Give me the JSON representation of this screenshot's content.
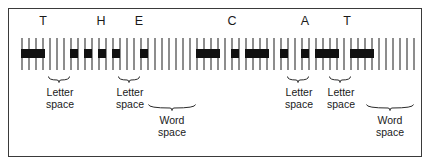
{
  "figure": {
    "message": "THE CAT",
    "border_color": "#3a3a3a",
    "tick_color": "#8d8d8d",
    "mark_color": "#111111",
    "background": "#ffffff"
  },
  "letters": [
    {
      "label": "T",
      "x": 43
    },
    {
      "label": "H",
      "x": 101
    },
    {
      "label": "E",
      "x": 139
    },
    {
      "label": "C",
      "x": 232
    },
    {
      "label": "A",
      "x": 305
    },
    {
      "label": "T",
      "x": 347
    }
  ],
  "strip": {
    "tick_top": 38,
    "tick_height": 32,
    "tick_width": 1.5,
    "mark_top": 49,
    "mark_height": 9,
    "tick_x": [
      21,
      28,
      35,
      42,
      49,
      56,
      63,
      70,
      77,
      84,
      91,
      98,
      105,
      112,
      119,
      126,
      133,
      140,
      147,
      154,
      161,
      168,
      175,
      182,
      189,
      196,
      203,
      210,
      217,
      224,
      231,
      238,
      245,
      252,
      259,
      266,
      273,
      280,
      287,
      294,
      301,
      308,
      315,
      322,
      329,
      336,
      343,
      350,
      357,
      364,
      371,
      378,
      385,
      392,
      399,
      406,
      413
    ],
    "marks": [
      {
        "x": 21,
        "width": 24,
        "symbol": "dash",
        "letter": "T"
      },
      {
        "x": 70,
        "width": 8,
        "symbol": "dot",
        "letter": "H"
      },
      {
        "x": 84,
        "width": 8,
        "symbol": "dot",
        "letter": "H"
      },
      {
        "x": 98,
        "width": 8,
        "symbol": "dot",
        "letter": "H"
      },
      {
        "x": 112,
        "width": 8,
        "symbol": "dot",
        "letter": "H"
      },
      {
        "x": 140,
        "width": 8,
        "symbol": "dot",
        "letter": "E"
      },
      {
        "x": 196,
        "width": 24,
        "symbol": "dash",
        "letter": "C"
      },
      {
        "x": 231,
        "width": 8,
        "symbol": "dot",
        "letter": "C"
      },
      {
        "x": 245,
        "width": 24,
        "symbol": "dash",
        "letter": "C"
      },
      {
        "x": 280,
        "width": 8,
        "symbol": "dot",
        "letter": "C"
      },
      {
        "x": 301,
        "width": 8,
        "symbol": "dot",
        "letter": "A"
      },
      {
        "x": 315,
        "width": 24,
        "symbol": "dash",
        "letter": "A"
      },
      {
        "x": 350,
        "width": 24,
        "symbol": "dash",
        "letter": "T"
      }
    ]
  },
  "annotations": [
    {
      "id": "letter-space-1",
      "text": "Letter\nspace",
      "brace_left": 48,
      "brace_width": 22,
      "brace_top": 76,
      "label_left": 32,
      "label_top": 86,
      "label_width": 56
    },
    {
      "id": "letter-space-2",
      "text": "Letter\nspace",
      "brace_left": 118,
      "brace_width": 22,
      "brace_top": 76,
      "label_left": 102,
      "label_top": 86,
      "label_width": 56
    },
    {
      "id": "word-space-1",
      "text": "Word\nspace",
      "brace_left": 148,
      "brace_width": 48,
      "brace_top": 104,
      "label_left": 146,
      "label_top": 114,
      "label_width": 52
    },
    {
      "id": "letter-space-3",
      "text": "Letter\nspace",
      "brace_left": 287,
      "brace_width": 22,
      "brace_top": 76,
      "label_left": 271,
      "label_top": 86,
      "label_width": 56
    },
    {
      "id": "letter-space-4",
      "text": "Letter\nspace",
      "brace_left": 329,
      "brace_width": 22,
      "brace_top": 76,
      "label_left": 313,
      "label_top": 86,
      "label_width": 56
    },
    {
      "id": "word-space-2",
      "text": "Word\nspace",
      "brace_left": 366,
      "brace_width": 48,
      "brace_top": 104,
      "label_left": 364,
      "label_top": 114,
      "label_width": 52
    }
  ]
}
